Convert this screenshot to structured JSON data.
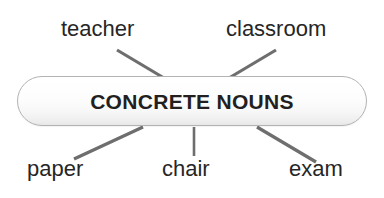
{
  "diagram": {
    "type": "concept-map",
    "title": "CONCRETE NOUNS",
    "central_node": {
      "label": "CONCRETE NOUNS",
      "shape": "rounded-rectangle",
      "fill": "#fdfdfd",
      "border_color": "#b3b3b3",
      "text_color": "#231f20"
    },
    "branches": [
      {
        "label": "teacher",
        "position": "top-left",
        "connector": "diagonal-line"
      },
      {
        "label": "classroom",
        "position": "top-right",
        "connector": "diagonal-line"
      },
      {
        "label": "paper",
        "position": "bottom-left",
        "connector": "diagonal-line"
      },
      {
        "label": "chair",
        "position": "bottom-center",
        "connector": "vertical-line"
      },
      {
        "label": "exam",
        "position": "bottom-right",
        "connector": "diagonal-line"
      }
    ],
    "connector_color": "#6e6e6e",
    "background": "#ffffff"
  }
}
